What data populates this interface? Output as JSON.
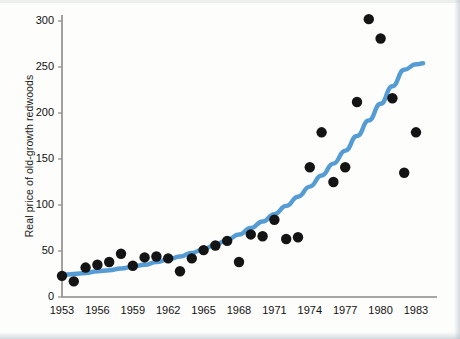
{
  "figure": {
    "ylabel": "Real price of old-growth redwoods",
    "xlabel": ""
  },
  "chart_data": {
    "type": "scatter",
    "title": "",
    "xlabel": "",
    "ylabel": "Real price of old-growth redwoods",
    "xlim": [
      1952.3,
      1984.0
    ],
    "ylim": [
      0,
      315
    ],
    "grid": false,
    "legend": null,
    "x_tick_labels": [
      "1953",
      "1956",
      "1959",
      "1962",
      "1965",
      "1968",
      "1971",
      "1974",
      "1977",
      "1980",
      "1983"
    ],
    "x_ticks": [
      1953,
      1956,
      1959,
      1962,
      1965,
      1968,
      1971,
      1974,
      1977,
      1980,
      1983
    ],
    "y_tick_labels": [
      "0",
      "50",
      "100",
      "150",
      "200",
      "250",
      "300"
    ],
    "y_ticks": [
      0,
      50,
      100,
      150,
      200,
      250,
      300
    ],
    "marker_color": "#141414",
    "marker_size": 5.2,
    "series": [
      {
        "name": "Real price of old-growth redwoods",
        "type": "scatter",
        "x": [
          1953,
          1954,
          1955,
          1956,
          1957,
          1958,
          1959,
          1960,
          1961,
          1962,
          1963,
          1964,
          1965,
          1966,
          1967,
          1968,
          1969,
          1970,
          1971,
          1972,
          1973,
          1974,
          1975,
          1976,
          1977,
          1978,
          1979,
          1980,
          1981,
          1982,
          1983
        ],
        "y": [
          23,
          17,
          32,
          35,
          38,
          47,
          34,
          43,
          44,
          42,
          28,
          42,
          51,
          56,
          61,
          38,
          68,
          66,
          84,
          63,
          65,
          141,
          179,
          125,
          141,
          212,
          302,
          281,
          216,
          135,
          179
        ]
      },
      {
        "name": "fitted exponential trend",
        "type": "line",
        "color": "#559cd4",
        "linewidth": 4.4,
        "x": [
          1953,
          1954,
          1955,
          1956,
          1957,
          1958,
          1959,
          1960,
          1961,
          1962,
          1963,
          1964,
          1965,
          1966,
          1967,
          1968,
          1969,
          1970,
          1971,
          1972,
          1973,
          1974,
          1975,
          1976,
          1977,
          1978,
          1979,
          1980,
          1981,
          1982,
          1983,
          1983.6
        ],
        "y": [
          24,
          25,
          26,
          28,
          29,
          31,
          33,
          35,
          38,
          41,
          44,
          48,
          52,
          57,
          62,
          68,
          75,
          82,
          90,
          99,
          109,
          120,
          132,
          145,
          159,
          175,
          192,
          210,
          229,
          247,
          253,
          254
        ]
      }
    ]
  }
}
